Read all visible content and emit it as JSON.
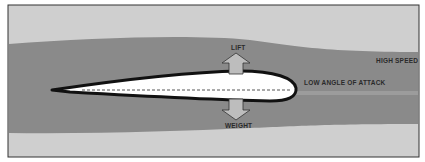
{
  "diagram": {
    "type": "airfoil-airflow",
    "labels": {
      "lift": "LIFT",
      "weight": "WEIGHT",
      "high_speed": "HIGH SPEED",
      "low_angle": "LOW ANGLE OF ATTACK"
    },
    "colors": {
      "background": "#cfcfcf",
      "airflow_band": "#8a8a8a",
      "airflow_stripe": "#9c9c9c",
      "airfoil_fill": "#ffffff",
      "airfoil_outline": "#111111",
      "arrow_fill": "#bdbdbd",
      "arrow_outline": "#333333",
      "frame": "#333333",
      "text": "#2a2a2a"
    }
  }
}
